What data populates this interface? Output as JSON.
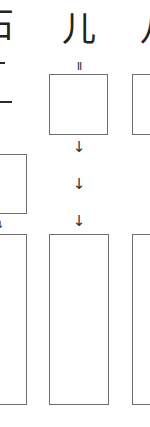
{
  "columns": [
    {
      "id": "left",
      "heading": "石",
      "glyph_fragments": [
        "十",
        "一"
      ]
    },
    {
      "id": "middle",
      "heading": "儿",
      "top_mark": "II",
      "arrows": [
        "↓",
        "↓",
        "↓"
      ]
    },
    {
      "id": "right",
      "heading": "八"
    }
  ],
  "colors": {
    "box_border": "#6e6e6e",
    "text": "#222222",
    "background": "#ffffff"
  }
}
